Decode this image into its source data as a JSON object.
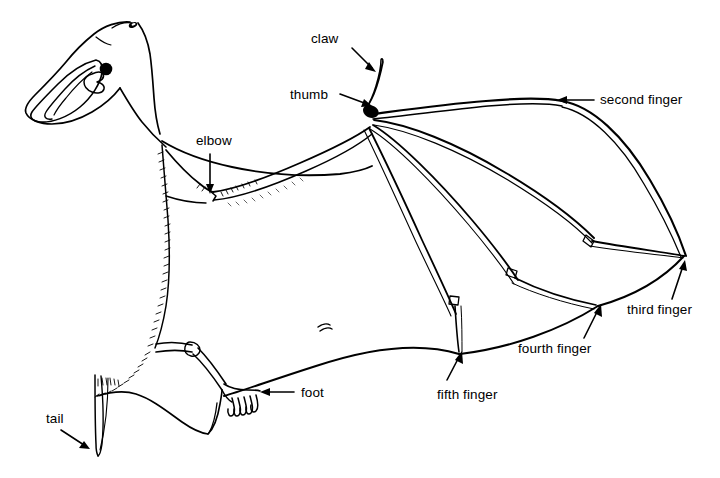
{
  "figure": {
    "background_color": "#ffffff",
    "ink_color": "#000000",
    "width": 720,
    "height": 478
  },
  "labels": [
    {
      "id": "claw",
      "text": "claw",
      "text_x": 311,
      "text_y": 43,
      "anchor": "start",
      "leader": "M 352 48 L 372 68",
      "head_x": 374,
      "head_y": 70,
      "head_angle": 45
    },
    {
      "id": "thumb",
      "text": "thumb",
      "text_x": 290,
      "text_y": 99,
      "anchor": "start",
      "leader": "M 340 94 L 367 104",
      "head_x": 370,
      "head_y": 105,
      "head_angle": 20
    },
    {
      "id": "second-finger",
      "text": "second finger",
      "text_x": 600,
      "text_y": 104,
      "anchor": "start",
      "leader": "M 594 100 L 563 100",
      "head_x": 559,
      "head_y": 100,
      "head_angle": 180
    },
    {
      "id": "elbow",
      "text": "elbow",
      "text_x": 196,
      "text_y": 145,
      "anchor": "start",
      "leader": "M 210 155 L 210 188",
      "head_x": 210,
      "head_y": 192,
      "head_angle": 90
    },
    {
      "id": "third-finger",
      "text": "third finger",
      "text_x": 627,
      "text_y": 314,
      "anchor": "start",
      "leader": "M 672 299 L 683 266",
      "head_x": 684,
      "head_y": 261,
      "head_angle": -72
    },
    {
      "id": "fourth-finger",
      "text": "fourth finger",
      "text_x": 518,
      "text_y": 353,
      "anchor": "start",
      "leader": "M 584 338 L 598 310",
      "head_x": 600,
      "head_y": 306,
      "head_angle": -64
    },
    {
      "id": "fifth-finger",
      "text": "fifth finger",
      "text_x": 437,
      "text_y": 399,
      "anchor": "start",
      "leader": "M 447 380 L 459 357",
      "head_x": 461,
      "head_y": 353,
      "head_angle": -62
    },
    {
      "id": "foot",
      "text": "foot",
      "text_x": 301,
      "text_y": 397,
      "anchor": "start",
      "leader": "M 294 392 L 265 392",
      "head_x": 261,
      "head_y": 392,
      "head_angle": 180
    },
    {
      "id": "tail",
      "text": "tail",
      "text_x": 46,
      "text_y": 423,
      "anchor": "start",
      "leader": "M 61 430 L 85 446",
      "head_x": 89,
      "head_y": 449,
      "head_angle": 33
    }
  ]
}
